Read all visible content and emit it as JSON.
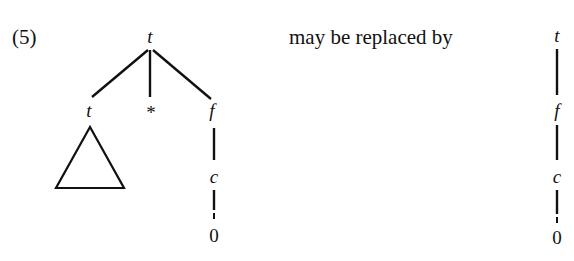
{
  "equation_number": "(5)",
  "connector_text": "may be replaced by",
  "left_tree": {
    "root": "t",
    "children": [
      {
        "label": "t",
        "subtree": "triangle"
      },
      {
        "label": "*"
      },
      {
        "label": "f",
        "chain": [
          "c",
          "0"
        ]
      }
    ]
  },
  "right_tree": {
    "chain": [
      "t",
      "f",
      "c",
      "0"
    ]
  }
}
